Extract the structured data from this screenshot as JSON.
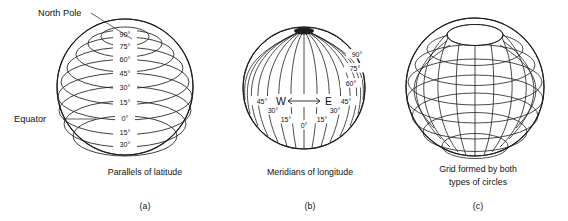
{
  "figure": {
    "background": "#ffffff",
    "ink_color": "#1d1d1d",
    "annotations": {
      "north_pole": "North Pole",
      "equator": "Equator"
    },
    "panels": [
      {
        "letter": "(a)",
        "caption_line1": "Parallels of latitude",
        "caption_line2": "",
        "type": "parallels",
        "latitude_labels": [
          "90°",
          "75°",
          "60°",
          "45°",
          "30°",
          "15°",
          "0°",
          "15°",
          "30°"
        ]
      },
      {
        "letter": "(b)",
        "caption_line1": "Meridians of longitude",
        "caption_line2": "",
        "type": "meridians",
        "direction_west": "W",
        "direction_east": "E",
        "longitude_labels_left": [
          "45°",
          "30°",
          "15°"
        ],
        "longitude_label_center": "0°",
        "longitude_labels_right": [
          "15°",
          "30°",
          "45°"
        ],
        "edge_labels_right": [
          "90°",
          "75°",
          "60°"
        ]
      },
      {
        "letter": "(c)",
        "caption_line1": "Grid formed by both",
        "caption_line2": "types of circles",
        "type": "grid",
        "latitude_labels": [],
        "longitude_labels_left": []
      }
    ]
  }
}
